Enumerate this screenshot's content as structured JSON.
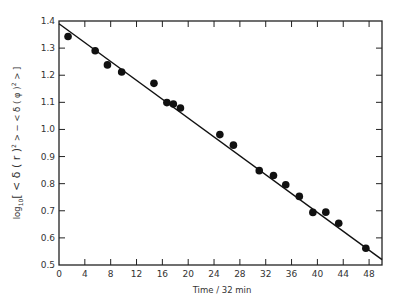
{
  "chart_data": {
    "type": "scatter",
    "title": "",
    "xlabel": "Time / 32 min",
    "ylabel": "log10[<δ(r)²> − <δ(φ)²>]",
    "ylabel_parts": {
      "prefix": "log",
      "sub": "10",
      "body": "[ < δ ( r )",
      "sup1": "2",
      "mid": " > − < δ ( φ )",
      "sup2": "2",
      "end": " > ]"
    },
    "xlim": [
      0,
      50
    ],
    "ylim": [
      0.5,
      1.4
    ],
    "xticks": [
      0,
      4,
      8,
      12,
      16,
      20,
      24,
      28,
      32,
      36,
      40,
      44,
      48
    ],
    "yticks": [
      0.5,
      0.6,
      0.7,
      0.8,
      0.9,
      1.0,
      1.1,
      1.2,
      1.3,
      1.4
    ],
    "ytick_labels": [
      "0.5",
      "0.6",
      "0.7",
      "0.8",
      "0.9",
      "1.0",
      "1.1",
      "1.2",
      "1.3",
      "1.4"
    ],
    "grid": false,
    "legend": null,
    "series": [
      {
        "name": "measured",
        "marker": "filled-circle",
        "x": [
          1.4,
          5.6,
          7.5,
          9.7,
          14.7,
          16.7,
          17.7,
          18.8,
          24.9,
          27.0,
          31.0,
          33.2,
          35.1,
          37.2,
          39.3,
          41.3,
          43.3,
          47.5
        ],
        "y": [
          1.343,
          1.29,
          1.238,
          1.212,
          1.17,
          1.099,
          1.094,
          1.079,
          0.981,
          0.942,
          0.848,
          0.83,
          0.796,
          0.753,
          0.694,
          0.695,
          0.654,
          0.562
        ]
      },
      {
        "name": "linear fit",
        "type": "line",
        "x": [
          0,
          50
        ],
        "y": [
          1.39,
          0.52
        ]
      }
    ]
  }
}
